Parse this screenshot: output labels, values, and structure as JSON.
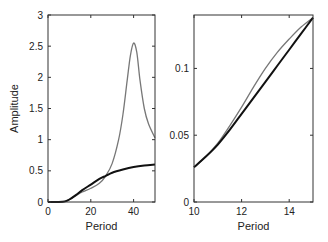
{
  "chart_data": [
    {
      "type": "line",
      "title": "",
      "xlabel": "Period",
      "ylabel": "Amplitude",
      "xlim": [
        0,
        50
      ],
      "ylim": [
        0,
        3
      ],
      "xticks": [
        0,
        20,
        40
      ],
      "yticks": [
        0,
        0.5,
        1,
        1.5,
        2,
        2.5,
        3
      ],
      "xtick_labels": [
        "0",
        "20",
        "40"
      ],
      "ytick_labels": [
        "0",
        "0.5",
        "1",
        "1.5",
        "2",
        "2.5",
        "3"
      ],
      "grid": false,
      "series": [
        {
          "name": "black",
          "color": "#111111",
          "x": [
            0,
            5,
            8,
            10,
            13,
            16,
            20,
            24,
            27,
            30,
            35,
            40,
            45,
            50
          ],
          "values": [
            0,
            0,
            0.01,
            0.04,
            0.11,
            0.19,
            0.28,
            0.37,
            0.42,
            0.47,
            0.52,
            0.56,
            0.585,
            0.6
          ]
        },
        {
          "name": "gray",
          "color": "#777777",
          "x": [
            0,
            5,
            8,
            10,
            13,
            16,
            20,
            24,
            27,
            30,
            33,
            35,
            37,
            38.5,
            40,
            41.5,
            43,
            45,
            47,
            50
          ],
          "values": [
            0,
            0,
            0.01,
            0.04,
            0.1,
            0.16,
            0.22,
            0.3,
            0.42,
            0.62,
            1.0,
            1.4,
            1.95,
            2.35,
            2.55,
            2.4,
            1.95,
            1.5,
            1.25,
            1.03
          ]
        }
      ]
    },
    {
      "type": "line",
      "title": "",
      "xlabel": "Period",
      "ylabel": "",
      "xlim": [
        10,
        15
      ],
      "ylim": [
        0,
        0.14
      ],
      "xticks": [
        10,
        12,
        14
      ],
      "yticks": [
        0,
        0.05,
        0.1
      ],
      "xtick_labels": [
        "10",
        "12",
        "14"
      ],
      "ytick_labels": [
        "0",
        "0.05",
        "0.1"
      ],
      "grid": false,
      "series": [
        {
          "name": "black",
          "color": "#111111",
          "x": [
            10,
            10.5,
            11,
            11.5,
            12,
            12.5,
            13,
            13.5,
            14,
            14.5,
            15
          ],
          "values": [
            0.026,
            0.034,
            0.043,
            0.054,
            0.066,
            0.078,
            0.09,
            0.102,
            0.114,
            0.126,
            0.138
          ]
        },
        {
          "name": "gray",
          "color": "#777777",
          "x": [
            10,
            10.5,
            11,
            11.5,
            12,
            12.5,
            13,
            13.5,
            14,
            14.5,
            15
          ],
          "values": [
            0.026,
            0.034,
            0.044,
            0.057,
            0.071,
            0.086,
            0.1,
            0.112,
            0.122,
            0.131,
            0.138
          ]
        }
      ]
    }
  ]
}
